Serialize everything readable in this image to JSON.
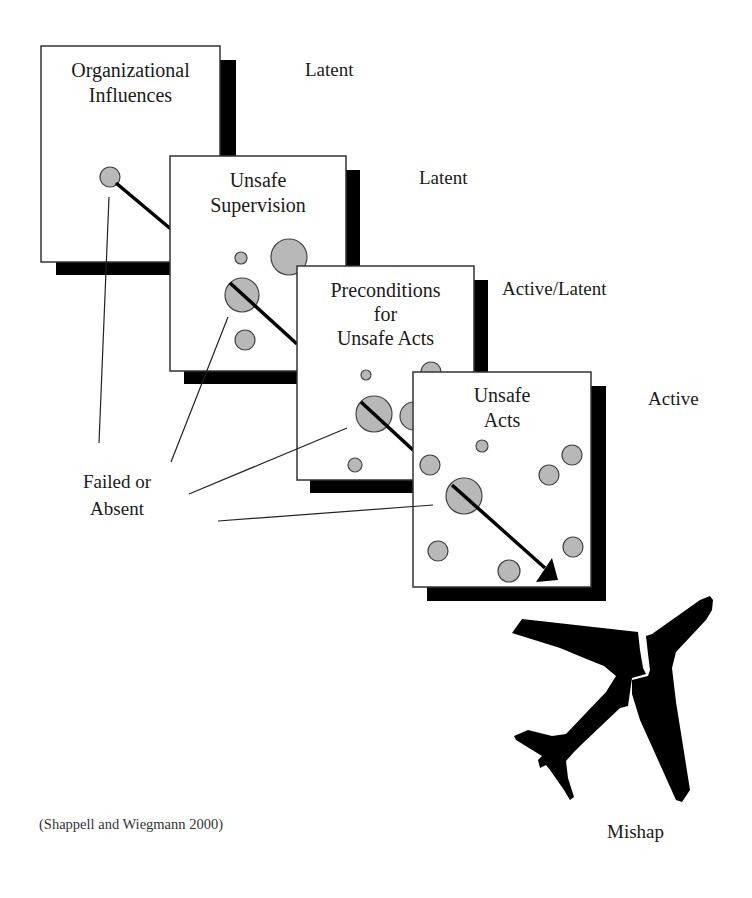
{
  "layers": [
    {
      "title_line1": "Organizational",
      "title_line2": "Influences",
      "title_line3": "",
      "status": "Latent"
    },
    {
      "title_line1": "Unsafe",
      "title_line2": "Supervision",
      "title_line3": "",
      "status": "Latent"
    },
    {
      "title_line1": "Preconditions",
      "title_line2": "for",
      "title_line3": "Unsafe Acts",
      "status": "Active/Latent"
    },
    {
      "title_line1": "Unsafe",
      "title_line2": "Acts",
      "title_line3": "",
      "status": "Active"
    }
  ],
  "annotation": {
    "line1": "Failed or",
    "line2": "Absent"
  },
  "outcome": {
    "label": "Mishap",
    "icon": "broken-airplane-icon"
  },
  "citation": "(Shappell and Wiegmann 2000)",
  "colors": {
    "hole_fill": "#b8b8b8",
    "shadow": "#000000",
    "box_border": "#333333",
    "text": "#1a1a1a"
  }
}
